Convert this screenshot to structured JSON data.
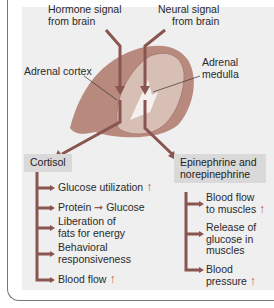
{
  "labels": {
    "hormone_signal": [
      "Hormone signal",
      "from brain"
    ],
    "neural_signal": [
      "Neural signal",
      "from brain"
    ],
    "adrenal_cortex": "Adrenal cortex",
    "adrenal_medulla": [
      "Adrenal",
      "medulla"
    ]
  },
  "cortisol": {
    "title": "Cortisol",
    "effects": [
      {
        "lines": [
          "Glucose utilization"
        ],
        "arrow": "up"
      },
      {
        "lines": [
          "Protein",
          "Glucose"
        ],
        "arrow": "conversion"
      },
      {
        "lines": [
          "Liberation of",
          "fats for energy"
        ],
        "arrow": null
      },
      {
        "lines": [
          "Behavioral",
          "responsiveness"
        ],
        "arrow": null
      },
      {
        "lines": [
          "Blood flow"
        ],
        "arrow": "up"
      }
    ]
  },
  "catecholamines": {
    "title": [
      "Epinephrine and",
      "norepinephrine"
    ],
    "effects": [
      {
        "lines": [
          "Blood flow",
          "to muscles"
        ],
        "arrow": "up"
      },
      {
        "lines": [
          "Release of",
          "glucose in",
          "muscles"
        ],
        "arrow": null
      },
      {
        "lines": [
          "Blood",
          "pressure"
        ],
        "arrow": "up"
      }
    ]
  },
  "colors": {
    "arrow": "#8a5550",
    "up_arrow": "#b85a4d",
    "panel_bg": "#efefef",
    "box_bg": "#d9d9d9",
    "gland_outer": "#c49a8e",
    "gland_inner": "#dcc4bb"
  }
}
